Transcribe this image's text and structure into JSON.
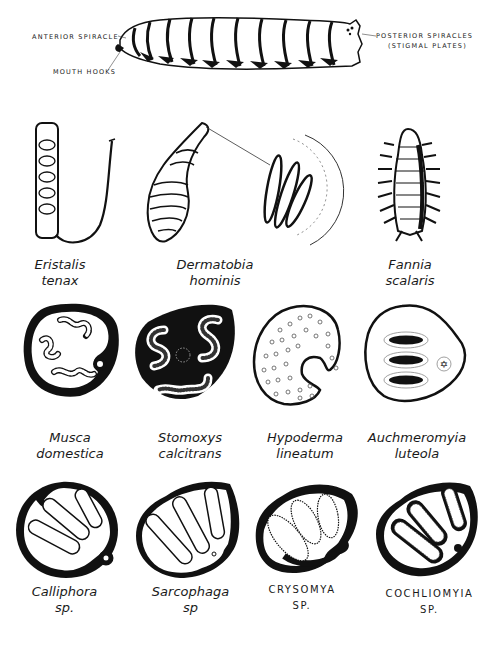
{
  "figure": {
    "larva_labels": {
      "anterior_spiracle": "ANTERIOR SPIRACLE",
      "mouth_hooks": "MOUTH HOOKS",
      "posterior_spiracles_line1": "POSTERIOR SPIRACLES",
      "posterior_spiracles_line2": "(STIGMAL PLATES)"
    },
    "row1": [
      {
        "genus": "Eristalis",
        "species": "tenax"
      },
      {
        "genus": "Dermatobia",
        "species": "hominis"
      },
      {
        "genus": "Fannia",
        "species": "scalaris"
      }
    ],
    "row2": [
      {
        "genus": "Musca",
        "species": "domestica"
      },
      {
        "genus": "Stomoxys",
        "species": "calcitrans"
      },
      {
        "genus": "Hypoderma",
        "species": "lineatum"
      },
      {
        "genus": "Auchmeromyia",
        "species": "luteola"
      }
    ],
    "row3": [
      {
        "genus": "Calliphora",
        "species": "sp."
      },
      {
        "genus": "Sarcophaga",
        "species": "sp"
      },
      {
        "genus": "CRYSOMYA",
        "species": "SP."
      },
      {
        "genus": "COCHLIOMYIA",
        "species": "SP."
      }
    ],
    "colors": {
      "ink": "#111111",
      "paper": "#ffffff"
    }
  }
}
